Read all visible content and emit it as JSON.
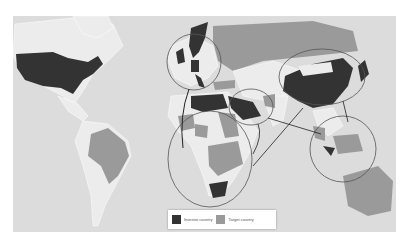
{
  "map": {
    "title": "",
    "colors": {
      "ocean": "#dcdcdc",
      "land": "#ececec",
      "investor": "#333333",
      "target": "#9a9a9a",
      "border": "#ffffff",
      "circle": "#555555",
      "arrow": "#222222"
    },
    "investor_countries": [
      "United States",
      "United Kingdom",
      "Scandinavia",
      "Germany",
      "Italy",
      "Libya/Egypt",
      "Saudi Arabia / Gulf",
      "China",
      "South Africa"
    ],
    "target_countries": [
      "Brazil",
      "Russia",
      "Ukraine",
      "Turkey",
      "Sub-Saharan Africa",
      "Southeast Asia",
      "Indonesia",
      "Australia",
      "Pakistan"
    ],
    "regions_circled": [
      "Europe",
      "Middle East",
      "China / East Asia",
      "Sub-Saharan Africa",
      "Southeast Asia"
    ]
  },
  "legend": {
    "investor_label": "Investor country",
    "target_label": "Target country"
  },
  "caption": ""
}
